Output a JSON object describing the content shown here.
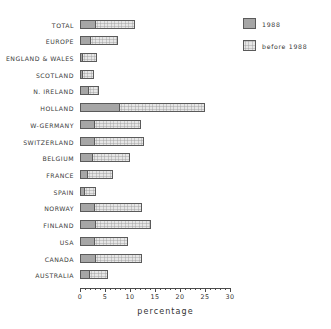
{
  "chart_data": {
    "type": "bar",
    "orientation": "horizontal",
    "stacked": true,
    "title": "",
    "xlabel": "percentage",
    "ylabel": "",
    "xlim": [
      0,
      30
    ],
    "xticks": [
      0,
      5,
      10,
      15,
      20,
      25,
      30
    ],
    "xtick_labels": [
      "0",
      "5",
      "10",
      "15",
      "20",
      "25",
      "30"
    ],
    "grid": false,
    "legend_position": "top-right",
    "categories": [
      "TOTAL",
      "EUROPE",
      "ENGLAND & WALES",
      "SCOTLAND",
      "N. IRELAND",
      "HOLLAND",
      "W-GERMANY",
      "SWITZERLAND",
      "BELGIUM",
      "FRANCE",
      "SPAIN",
      "NORWAY",
      "FINLAND",
      "USA",
      "CANADA",
      "AUSTRALIA"
    ],
    "series": [
      {
        "name": "1988",
        "color": "#a6a6a6",
        "values": [
          3.2,
          2.2,
          0.6,
          0.5,
          1.8,
          8.0,
          2.9,
          3.0,
          2.5,
          1.6,
          0.9,
          3.0,
          3.1,
          3.0,
          3.2,
          2.0
        ]
      },
      {
        "name": "before 1988",
        "color": "#e6e6e6",
        "values": [
          7.8,
          5.4,
          2.7,
          2.3,
          2.0,
          17.0,
          9.3,
          9.8,
          7.5,
          4.9,
          2.3,
          9.4,
          11.1,
          6.5,
          9.2,
          3.5
        ]
      }
    ],
    "totals": [
      11.0,
      7.6,
      3.3,
      2.8,
      3.8,
      25.0,
      12.2,
      12.8,
      10.0,
      6.5,
      3.2,
      12.4,
      14.2,
      9.5,
      12.4,
      5.5
    ]
  },
  "legend": {
    "items": [
      {
        "label": "1988",
        "swatch": "dark-hatch"
      },
      {
        "label": "before 1988",
        "swatch": "light-hatch"
      }
    ]
  },
  "axis": {
    "x_title": "percentage"
  }
}
